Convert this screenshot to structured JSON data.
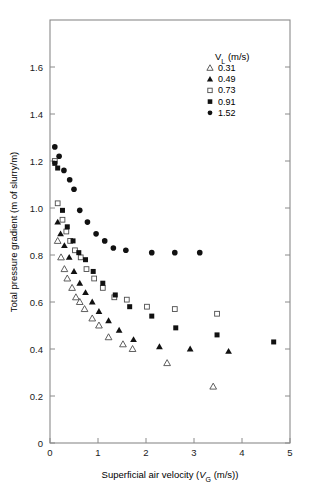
{
  "chart_data": {
    "type": "scatter",
    "title": "",
    "xlabel": "Superficial air velocity (VG (m/s))",
    "xlabel_parts": {
      "pre": "Superficial air velocity (",
      "ital": "V",
      "sub": "G",
      "post": " (m/s))"
    },
    "ylabel": "Total pressure gradient (m of slurry/m)",
    "xlim": [
      0,
      5
    ],
    "ylim": [
      0,
      1.8
    ],
    "xticks": [
      0,
      1,
      2,
      3,
      4,
      5
    ],
    "xtick_labels": [
      "0",
      "1",
      "2",
      "3",
      "4",
      "5"
    ],
    "yticks": [
      0,
      0.2,
      0.4,
      0.6,
      0.8,
      1.0,
      1.2,
      1.4,
      1.6
    ],
    "ytick_labels": [
      "0",
      "0.2",
      "0.4",
      "0.6",
      "0.8",
      "1.0",
      "1.2",
      "1.4",
      "1.6"
    ],
    "grid": false,
    "legend_position": "upper-right-inside",
    "legend_title": "VL (m/s)",
    "legend_title_parts": {
      "ital": "V",
      "sub": "L",
      "post": " (m/s)"
    },
    "series": [
      {
        "name": "0.31",
        "label": "0.31",
        "marker": "open-triangle",
        "color": "#4d4d4d",
        "points": [
          [
            0.16,
            0.86
          ],
          [
            0.23,
            0.79
          ],
          [
            0.3,
            0.74
          ],
          [
            0.36,
            0.7
          ],
          [
            0.46,
            0.66
          ],
          [
            0.54,
            0.62
          ],
          [
            0.62,
            0.6
          ],
          [
            0.72,
            0.57
          ],
          [
            0.88,
            0.53
          ],
          [
            1.02,
            0.5
          ],
          [
            1.22,
            0.45
          ],
          [
            1.52,
            0.42
          ],
          [
            1.72,
            0.4
          ],
          [
            2.44,
            0.34
          ],
          [
            3.4,
            0.24
          ]
        ]
      },
      {
        "name": "0.49",
        "label": "0.49",
        "marker": "filled-triangle",
        "color": "#111111",
        "points": [
          [
            0.16,
            0.94
          ],
          [
            0.22,
            0.89
          ],
          [
            0.3,
            0.84
          ],
          [
            0.4,
            0.79
          ],
          [
            0.5,
            0.73
          ],
          [
            0.62,
            0.68
          ],
          [
            0.74,
            0.64
          ],
          [
            0.88,
            0.6
          ],
          [
            1.02,
            0.56
          ],
          [
            1.22,
            0.52
          ],
          [
            1.44,
            0.48
          ],
          [
            1.74,
            0.44
          ],
          [
            2.28,
            0.41
          ],
          [
            2.92,
            0.4
          ],
          [
            3.72,
            0.39
          ]
        ]
      },
      {
        "name": "0.73",
        "label": "0.73",
        "marker": "open-square",
        "color": "#4d4d4d",
        "points": [
          [
            0.1,
            1.2
          ],
          [
            0.16,
            1.02
          ],
          [
            0.26,
            0.95
          ],
          [
            0.34,
            0.9
          ],
          [
            0.42,
            0.86
          ],
          [
            0.52,
            0.82
          ],
          [
            0.64,
            0.79
          ],
          [
            0.76,
            0.74
          ],
          [
            0.92,
            0.7
          ],
          [
            1.1,
            0.66
          ],
          [
            1.34,
            0.62
          ],
          [
            1.6,
            0.61
          ],
          [
            2.02,
            0.58
          ],
          [
            2.6,
            0.57
          ],
          [
            3.48,
            0.55
          ]
        ]
      },
      {
        "name": "0.91",
        "label": "0.91",
        "marker": "filled-square",
        "color": "#111111",
        "points": [
          [
            0.1,
            1.19
          ],
          [
            0.16,
            1.17
          ],
          [
            0.26,
            0.99
          ],
          [
            0.36,
            0.92
          ],
          [
            0.48,
            0.86
          ],
          [
            0.6,
            0.81
          ],
          [
            0.74,
            0.78
          ],
          [
            0.9,
            0.73
          ],
          [
            1.1,
            0.68
          ],
          [
            1.36,
            0.63
          ],
          [
            1.66,
            0.58
          ],
          [
            2.12,
            0.54
          ],
          [
            2.62,
            0.49
          ],
          [
            3.48,
            0.46
          ],
          [
            4.66,
            0.43
          ]
        ]
      },
      {
        "name": "1.52",
        "label": "1.52",
        "marker": "filled-circle",
        "color": "#111111",
        "points": [
          [
            0.1,
            1.26
          ],
          [
            0.19,
            1.22
          ],
          [
            0.29,
            1.16
          ],
          [
            0.41,
            1.12
          ],
          [
            0.5,
            1.08
          ],
          [
            0.62,
            0.99
          ],
          [
            0.78,
            0.94
          ],
          [
            0.96,
            0.89
          ],
          [
            1.14,
            0.86
          ],
          [
            1.32,
            0.83
          ],
          [
            1.58,
            0.82
          ],
          [
            2.12,
            0.81
          ],
          [
            2.6,
            0.81
          ],
          [
            3.12,
            0.81
          ]
        ]
      }
    ]
  },
  "axes_geometry": {
    "left_px": 50,
    "right_px": 290,
    "top_px": 20,
    "bottom_px": 443
  }
}
